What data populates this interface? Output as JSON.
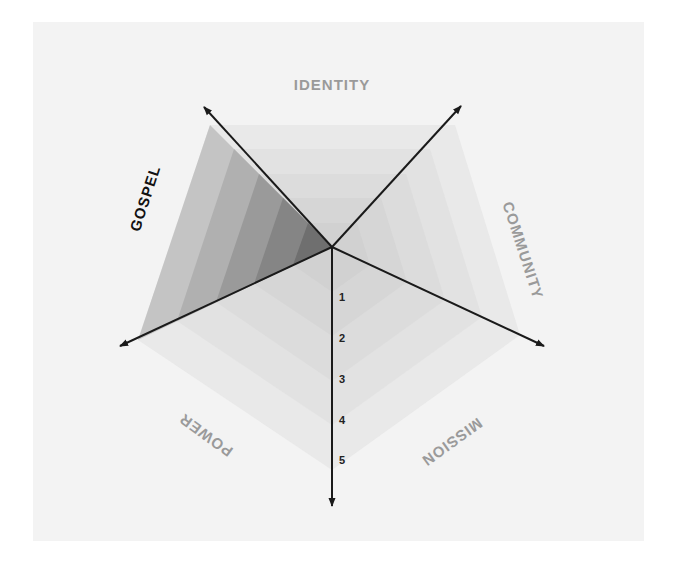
{
  "diagram": {
    "title": "",
    "axes": [
      {
        "key": "identity",
        "label": "IDENTITY",
        "emphasized": false
      },
      {
        "key": "community",
        "label": "COMMUNITY",
        "emphasized": false
      },
      {
        "key": "mission",
        "label": "MISSION",
        "emphasized": false
      },
      {
        "key": "power",
        "label": "POWER",
        "emphasized": false
      },
      {
        "key": "gospel",
        "label": "GOSPEL",
        "emphasized": true
      }
    ],
    "scale_ticks": [
      "1",
      "2",
      "3",
      "4",
      "5"
    ],
    "highlighted_sector": "GOSPEL",
    "levels": 5,
    "colors": {
      "background_panel": "#f3f3f3",
      "ring_fill": "#d8d8d8",
      "highlight_fill": "#6f6f6f",
      "axis_line": "#1a1a1a",
      "label_muted": "#9a9a9a",
      "label_emphasis": "#111111"
    }
  }
}
